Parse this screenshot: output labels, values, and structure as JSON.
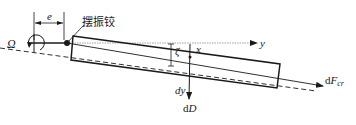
{
  "diagram": {
    "type": "blade-flapping-schematic",
    "labels": {
      "hinge_offset": "e",
      "hinge_name": "摆振铰",
      "rotation": "Ω",
      "angle": "ζ",
      "x_axis": "x",
      "y_axis": "y",
      "element": "dy",
      "drag_d": "d",
      "drag_D": "D",
      "force_d": "d",
      "force_F": "F",
      "force_sub": "cr"
    },
    "colors": {
      "line": "#1a1a1a",
      "dash": "#333333",
      "axis": "#8a8a8a",
      "background": "#ffffff"
    }
  }
}
